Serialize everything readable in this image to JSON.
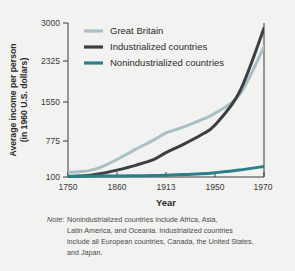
{
  "figure": {
    "background_color": "#f2f2f0",
    "note_prefix": "Note:",
    "note_lines": [
      "Nonindustrialized countries include Africa, Asia,",
      "Latin America, and Oceania. Industrialized countries",
      "include all European countries, Canada, the United States,",
      "and Japan."
    ]
  },
  "chart_data": {
    "type": "line",
    "title": "",
    "xlabel": "Year",
    "ylabel": "Average income per person (in 1960 U.S. dollars)",
    "ylabel_line1": "Average income per person",
    "ylabel_line2": "(in 1960 U.S. dollars)",
    "x_ticks": [
      "1750",
      "1860",
      "1913",
      "1950",
      "1970"
    ],
    "x_tick_values": [
      1750,
      1860,
      1913,
      1950,
      1970
    ],
    "y_ticks": [
      "100",
      "775",
      "1550",
      "2325",
      "3000"
    ],
    "y_tick_values": [
      100,
      775,
      1550,
      2325,
      3000
    ],
    "ylim": [
      100,
      3000
    ],
    "grid": false,
    "legend_position": "top-right-inside",
    "series": [
      {
        "name": "Great Britain",
        "color": "#a9bfc6",
        "x": [
          1750,
          1775,
          1800,
          1825,
          1860,
          1880,
          1900,
          1913,
          1925,
          1940,
          1950,
          1960,
          1970
        ],
        "values": [
          190,
          200,
          225,
          290,
          430,
          620,
          800,
          930,
          1030,
          1180,
          1300,
          1650,
          2550
        ]
      },
      {
        "name": "Industrialized countries",
        "color": "#3b3f42",
        "x": [
          1750,
          1775,
          1800,
          1825,
          1860,
          1880,
          1900,
          1913,
          1925,
          1940,
          1950,
          1960,
          1970
        ],
        "values": [
          110,
          118,
          135,
          165,
          230,
          320,
          430,
          560,
          700,
          900,
          1080,
          1700,
          2900
        ]
      },
      {
        "name": "Nonindustrialized countries",
        "color": "#2b7f8a",
        "x": [
          1750,
          1775,
          1800,
          1825,
          1860,
          1880,
          1900,
          1913,
          1925,
          1940,
          1950,
          1960,
          1970
        ],
        "values": [
          115,
          115,
          116,
          118,
          120,
          124,
          128,
          134,
          145,
          160,
          180,
          230,
          300
        ]
      }
    ]
  }
}
